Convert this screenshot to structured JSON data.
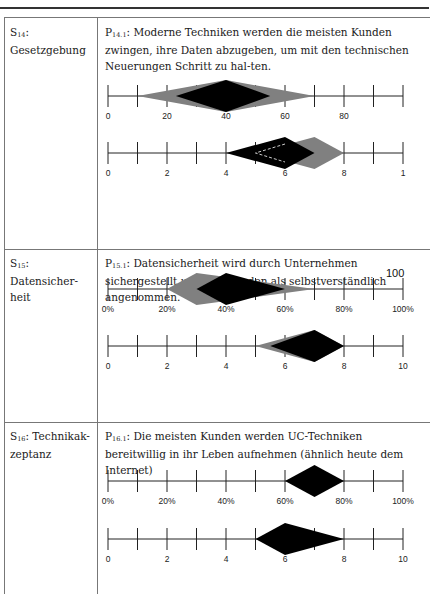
{
  "page": {
    "rows": [
      {
        "label_prefix": "S",
        "label_sub": "14",
        "label_text": ": Gesetzgebung",
        "stmt_prefix": "P",
        "stmt_sub": "14.1",
        "stmt_text": ": Moderne Techniken werden die meisten Kunden zwingen, ihre Daten abzugeben, um mit den technischen Neuerungen Schritt zu hal-ten."
      },
      {
        "label_prefix": "S",
        "label_sub": "15",
        "label_text": ": Datensicher-heit",
        "stmt_prefix": "P",
        "stmt_sub": "15.1",
        "stmt_text": ": Datensicherheit wird durch Unternehmen sichergestellt und von Kunden als selbstverständlich angenommen.",
        "stray_label": "100"
      },
      {
        "label_prefix": "S",
        "label_sub": "16",
        "label_text": ": Technikak-zeptanz",
        "stmt_prefix": "P",
        "stmt_sub": "16.1",
        "stmt_text": ": Die meisten Kunden werden UC-Techniken bereitwillig in ihr Leben aufnehmen (ähnlich heute dem Internet)"
      }
    ]
  },
  "chart_data": [
    {
      "type": "range-diamond",
      "row": "S14",
      "scale": "percent",
      "tick_labels": [
        "0",
        "",
        "20",
        "",
        "40",
        "",
        "60",
        "",
        "80",
        "",
        ""
      ],
      "range": [
        0,
        100
      ],
      "series": [
        {
          "name": "gray",
          "color": "#808080",
          "min": 10,
          "peak": 40,
          "max": 70
        },
        {
          "name": "black",
          "color": "#000000",
          "min": 23,
          "peak": 40,
          "max": 55
        }
      ]
    },
    {
      "type": "range-diamond",
      "row": "S14",
      "scale": "0-10",
      "tick_labels": [
        "0",
        "",
        "2",
        "",
        "4",
        "",
        "6",
        "",
        "8",
        "",
        "1"
      ],
      "range": [
        0,
        10
      ],
      "series": [
        {
          "name": "gray",
          "color": "#808080",
          "min": 5,
          "peak": 7,
          "max": 8
        },
        {
          "name": "black",
          "color": "#000000",
          "min": 4,
          "peak": 6,
          "max": 7
        },
        {
          "name": "dashed-overlay",
          "color": "#ffffff",
          "style": "dashed",
          "min": 5,
          "peak": 6,
          "max": 7
        }
      ]
    },
    {
      "type": "range-diamond",
      "row": "S15",
      "scale": "percent",
      "tick_labels": [
        "0%",
        "",
        "20%",
        "",
        "40%",
        "",
        "60%",
        "",
        "80%",
        "",
        "100%"
      ],
      "range": [
        0,
        100
      ],
      "series": [
        {
          "name": "gray",
          "color": "#808080",
          "min": 20,
          "peak": 30,
          "max": 70
        },
        {
          "name": "black",
          "color": "#000000",
          "min": 30,
          "peak": 40,
          "max": 60
        }
      ]
    },
    {
      "type": "range-diamond",
      "row": "S15",
      "scale": "0-10",
      "tick_labels": [
        "0",
        "",
        "2",
        "",
        "4",
        "",
        "6",
        "",
        "8",
        "",
        "10"
      ],
      "range": [
        0,
        10
      ],
      "series": [
        {
          "name": "gray",
          "color": "#808080",
          "min": 5,
          "peak": 7,
          "max": 8
        },
        {
          "name": "black",
          "color": "#000000",
          "min": 5.5,
          "peak": 7,
          "max": 8
        }
      ]
    },
    {
      "type": "range-diamond",
      "row": "S16",
      "scale": "percent",
      "tick_labels": [
        "0%",
        "",
        "20%",
        "",
        "40%",
        "",
        "60%",
        "",
        "80%",
        "",
        "100%"
      ],
      "range": [
        0,
        100
      ],
      "series": [
        {
          "name": "black",
          "color": "#000000",
          "min": 60,
          "peak": 70,
          "max": 80
        }
      ]
    },
    {
      "type": "range-diamond",
      "row": "S16",
      "scale": "0-10",
      "tick_labels": [
        "0",
        "",
        "2",
        "",
        "4",
        "",
        "6",
        "",
        "8",
        "",
        "10"
      ],
      "range": [
        0,
        10
      ],
      "series": [
        {
          "name": "black",
          "color": "#000000",
          "min": 5,
          "peak": 6,
          "max": 8
        }
      ]
    }
  ]
}
